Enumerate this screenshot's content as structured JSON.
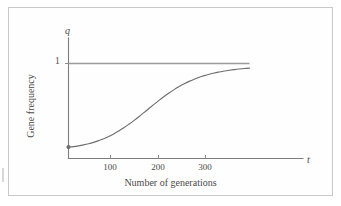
{
  "figure": {
    "name": "gene-frequency-vs-generations",
    "background_color": "#ffffff",
    "frame_color": "#c9c9c9",
    "ink_color": "#6e6e6e",
    "text_color": "#4a4a4a"
  },
  "chart_data": {
    "type": "line",
    "title": "",
    "xlabel": "Number of generations",
    "ylabel": "Gene frequency",
    "x_axis_variable": "t",
    "y_axis_variable": "q",
    "xlim": [
      0,
      380
    ],
    "ylim": [
      0,
      1.18
    ],
    "grid": false,
    "legend": null,
    "xticks": [
      100,
      200,
      300
    ],
    "xtick_labels": [
      "100",
      "200",
      "300"
    ],
    "yticks": [
      1
    ],
    "ytick_labels": [
      "1"
    ],
    "series": [
      {
        "name": "gene frequency q(t)",
        "style": "solid",
        "color": "#6e6e6e",
        "start_marker": true,
        "x": [
          0,
          10,
          20,
          30,
          40,
          50,
          60,
          70,
          80,
          90,
          100,
          110,
          120,
          130,
          140,
          150,
          160,
          170,
          180,
          190,
          200,
          210,
          220,
          230,
          240,
          250,
          260,
          270,
          280,
          290,
          300,
          310,
          320,
          330,
          340,
          350,
          360
        ],
        "y": [
          0.12,
          0.125,
          0.133,
          0.143,
          0.155,
          0.17,
          0.188,
          0.208,
          0.232,
          0.259,
          0.29,
          0.323,
          0.36,
          0.399,
          0.44,
          0.483,
          0.527,
          0.57,
          0.612,
          0.652,
          0.69,
          0.725,
          0.757,
          0.786,
          0.812,
          0.835,
          0.855,
          0.872,
          0.887,
          0.9,
          0.911,
          0.921,
          0.929,
          0.936,
          0.942,
          0.947,
          0.951
        ]
      },
      {
        "name": "asymptote q = 1",
        "style": "solid",
        "color": "#9a9a9a",
        "x": [
          0,
          360
        ],
        "y": [
          1,
          1
        ]
      }
    ],
    "annotations": [
      {
        "text": "q",
        "role": "y-axis-variable"
      },
      {
        "text": "t",
        "role": "x-axis-variable"
      },
      {
        "text": "1",
        "role": "y-tick-label"
      }
    ]
  },
  "labels": {
    "axis_var_y": "q",
    "axis_var_x": "t",
    "y_tick_1": "1",
    "x_tick_100": "100",
    "x_tick_200": "200",
    "x_tick_300": "300",
    "x_axis_title": "Number of generations",
    "y_axis_title": "Gene frequency"
  }
}
